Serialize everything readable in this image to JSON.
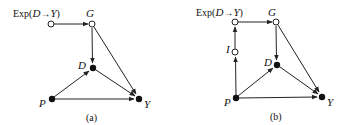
{
  "panels": [
    {
      "caption": "(a)",
      "exp_label_prefix": "Exp(",
      "exp_label_d": "D",
      "exp_label_arrow": "→",
      "exp_label_y": "Y",
      "exp_label_suffix": ")",
      "nodes": {
        "exp": {
          "label": "Exp(D→Y)",
          "type": "open"
        },
        "G": {
          "label": "G",
          "type": "open"
        },
        "D": {
          "label": "D",
          "type": "filled"
        },
        "P": {
          "label": "P",
          "type": "filled"
        },
        "Y": {
          "label": "Y",
          "type": "filled"
        }
      },
      "edges": [
        [
          "Exp(D→Y)",
          "G"
        ],
        [
          "G",
          "D"
        ],
        [
          "G",
          "Y"
        ],
        [
          "D",
          "Y"
        ],
        [
          "P",
          "D"
        ],
        [
          "P",
          "Y"
        ]
      ]
    },
    {
      "caption": "(b)",
      "exp_label_prefix": "Exp(",
      "exp_label_d": "D",
      "exp_label_arrow": "→",
      "exp_label_y": "Y",
      "exp_label_suffix": ")",
      "nodes": {
        "exp": {
          "label": "Exp(D→Y)",
          "type": "open"
        },
        "G": {
          "label": "G",
          "type": "open"
        },
        "I": {
          "label": "I",
          "type": "open"
        },
        "D": {
          "label": "D",
          "type": "filled"
        },
        "P": {
          "label": "P",
          "type": "filled"
        },
        "Y": {
          "label": "Y",
          "type": "filled"
        }
      },
      "edges": [
        [
          "P",
          "I"
        ],
        [
          "I",
          "Exp(D→Y)"
        ],
        [
          "Exp(D→Y)",
          "G"
        ],
        [
          "G",
          "D"
        ],
        [
          "G",
          "Y"
        ],
        [
          "D",
          "Y"
        ],
        [
          "P",
          "D"
        ],
        [
          "P",
          "Y"
        ]
      ]
    }
  ],
  "colors": {
    "line": "#222222",
    "node_fill": "#111111",
    "open_fill": "#ffffff"
  }
}
